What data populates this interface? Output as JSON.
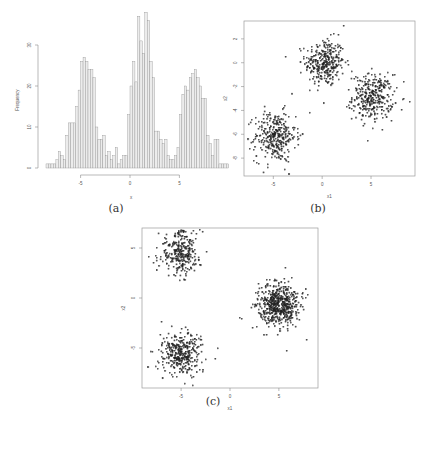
{
  "figure": {
    "captions": {
      "a": "(a)",
      "b": "(b)",
      "c": "(c)"
    }
  },
  "colors": {
    "bar_fill": "#ececec",
    "bar_stroke": "#8a8a8a",
    "axis": "#8a8a8a",
    "point": "#222222",
    "frame": "#9a9a9a"
  },
  "chart_data": [
    {
      "id": "a",
      "type": "bar",
      "title": "",
      "xlabel": "x",
      "ylabel": "Frequency",
      "bin_start": -8.5,
      "bin_width": 0.25,
      "values": [
        1,
        1,
        1,
        1,
        2,
        4,
        3,
        2,
        8,
        11,
        11,
        11,
        15,
        19,
        26,
        27,
        26,
        24,
        24,
        22,
        10,
        7,
        7,
        8,
        3,
        4,
        2,
        3,
        5,
        1,
        2,
        3,
        3,
        13,
        20,
        26,
        21,
        37,
        31,
        28,
        38,
        36,
        26,
        22,
        9,
        9,
        7,
        6,
        7,
        3,
        2,
        2,
        3,
        5,
        13,
        18,
        20,
        19,
        22,
        23,
        24,
        22,
        20,
        17,
        17,
        8,
        6,
        3,
        7,
        7,
        1,
        1,
        1,
        1
      ],
      "xticks": [
        -5,
        0,
        5
      ],
      "yticks": [
        0,
        10,
        20,
        30
      ],
      "xlim": [
        -8.5,
        8.5
      ],
      "ylim": [
        0,
        38
      ],
      "grid": false
    },
    {
      "id": "b",
      "type": "scatter",
      "xlabel": "x1",
      "ylabel": "x2",
      "xticks": [
        -5,
        0,
        5
      ],
      "yticks": [
        -8,
        -6,
        -4,
        -2,
        0,
        2
      ],
      "xlim": [
        -8,
        9.5
      ],
      "ylim": [
        -9.5,
        3.5
      ],
      "clusters": [
        {
          "center": [
            0.3,
            0.0
          ],
          "sd": [
            1.0,
            1.0
          ],
          "n": 320
        },
        {
          "center": [
            5.2,
            -2.9
          ],
          "sd": [
            1.05,
            0.95
          ],
          "n": 330
        },
        {
          "center": [
            -4.8,
            -6.2
          ],
          "sd": [
            1.05,
            1.05
          ],
          "n": 330
        }
      ],
      "outliers": [
        [
          2.2,
          3.1
        ],
        [
          0.2,
          -3.4
        ],
        [
          -2.0,
          -6.0
        ],
        [
          9.0,
          -3.3
        ],
        [
          -6.0,
          -9.2
        ]
      ]
    },
    {
      "id": "c",
      "type": "scatter",
      "xlabel": "x1",
      "ylabel": "x2",
      "xticks": [
        -5,
        0,
        5
      ],
      "yticks": [
        -5,
        0,
        5
      ],
      "xlim": [
        -9,
        9
      ],
      "ylim": [
        -9,
        7
      ],
      "clusters": [
        {
          "center": [
            -5.1,
            4.5
          ],
          "sd": [
            1.05,
            1.1
          ],
          "n": 300
        },
        {
          "center": [
            5.0,
            -0.7
          ],
          "sd": [
            1.05,
            1.05
          ],
          "n": 550
        },
        {
          "center": [
            -5.0,
            -5.5
          ],
          "sd": [
            1.0,
            1.0
          ],
          "n": 350
        }
      ],
      "outliers": [
        [
          -8.3,
          4.1
        ],
        [
          1.0,
          -2.0
        ],
        [
          1.2,
          -2.1
        ],
        [
          -1.5,
          -6.1
        ],
        [
          5.8,
          -5.3
        ],
        [
          -7.0,
          -2.4
        ],
        [
          8.0,
          0.3
        ]
      ]
    }
  ]
}
